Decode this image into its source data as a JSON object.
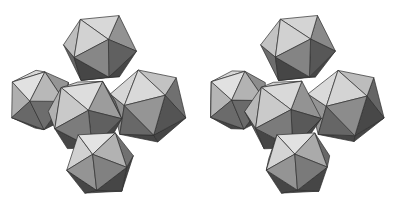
{
  "figure": {
    "views": [
      {
        "name": "left-view",
        "offset_x": 0
      },
      {
        "name": "right-view",
        "offset_x": 200
      }
    ],
    "colors": {
      "light": "#dcdcdc",
      "mid_light": "#bdbdbd",
      "mid": "#9a9a9a",
      "dark": "#6e6e6e",
      "darker": "#555555",
      "edge": "#2e2e2e",
      "background": "#ffffff"
    },
    "icosahedra": [
      {
        "name": "top",
        "cx": 100,
        "cy": 48,
        "r": 38
      },
      {
        "name": "left",
        "cx": 40,
        "cy": 100,
        "r": 34
      },
      {
        "name": "right",
        "cx": 148,
        "cy": 106,
        "r": 40
      },
      {
        "name": "middle",
        "cx": 85,
        "cy": 115,
        "r": 40
      },
      {
        "name": "bottom",
        "cx": 100,
        "cy": 163,
        "r": 36
      }
    ]
  }
}
